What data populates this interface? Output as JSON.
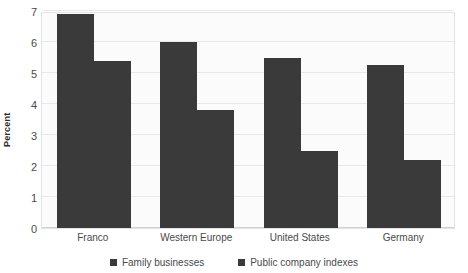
{
  "chart_data": {
    "type": "bar",
    "title": "",
    "subtitle": "",
    "xlabel": "",
    "ylabel": "Percent",
    "categories": [
      "Franco",
      "Western Europe",
      "United States",
      "Germany"
    ],
    "series": [
      {
        "name": "Family businesses",
        "values": [
          6.9,
          6.0,
          5.5,
          5.25
        ],
        "color": "#3a3a3a"
      },
      {
        "name": "Public company indexes",
        "values": [
          5.4,
          3.8,
          2.5,
          2.2
        ],
        "color": "#3a3a3a"
      }
    ],
    "ylim": [
      0,
      7
    ],
    "yticks": [
      0,
      1,
      2,
      3,
      4,
      5,
      6,
      7
    ],
    "ytick_labels": [
      "0",
      "1",
      "2",
      "3",
      "4",
      "5",
      "6",
      "7"
    ],
    "grid": true,
    "grid_axis": "y",
    "legend_position": "bottom-center",
    "bar_orientation": "vertical",
    "grouped": true
  },
  "colors": {
    "bar": "#3a3a3a",
    "plot_background": "#fbfbfb",
    "page_background": "#ffffff",
    "gridline": "#e8e8e8",
    "axis_line": "#d2d2d2",
    "tick_text": "#4a4a4a",
    "axis_title_text": "#2b2b2b"
  }
}
